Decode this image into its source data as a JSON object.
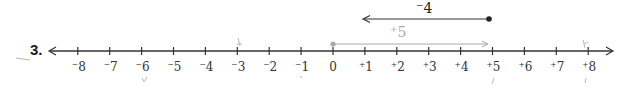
{
  "problem": {
    "number": "3."
  },
  "number_line": {
    "min": -8,
    "max": 8,
    "ticks": [
      {
        "value": -8,
        "label": "⁻8"
      },
      {
        "value": -7,
        "label": "⁻7"
      },
      {
        "value": -6,
        "label": "⁻6"
      },
      {
        "value": -5,
        "label": "⁻5"
      },
      {
        "value": -4,
        "label": "⁻4"
      },
      {
        "value": -3,
        "label": "⁻3"
      },
      {
        "value": -2,
        "label": "⁻2"
      },
      {
        "value": -1,
        "label": "⁻1"
      },
      {
        "value": 0,
        "label": "0"
      },
      {
        "value": 1,
        "label": "⁺1"
      },
      {
        "value": 2,
        "label": "⁺2"
      },
      {
        "value": 3,
        "label": "⁺3"
      },
      {
        "value": 4,
        "label": "⁺4"
      },
      {
        "value": 5,
        "label": "⁺5"
      },
      {
        "value": 6,
        "label": "⁺6"
      },
      {
        "value": 7,
        "label": "⁺7"
      },
      {
        "value": 8,
        "label": "⁺8"
      }
    ]
  },
  "vectors": [
    {
      "name": "plus-five",
      "start": 0,
      "end": 5,
      "label": "⁺5",
      "color": "#aaaaaa"
    },
    {
      "name": "minus-four",
      "start": 5,
      "end": 1,
      "label": "⁻4",
      "color": "#333333"
    }
  ],
  "colors": {
    "axis": "#333333",
    "vector_light": "#aaaaaa",
    "vector_dark": "#333333",
    "pencil": "#b0b0b0"
  }
}
